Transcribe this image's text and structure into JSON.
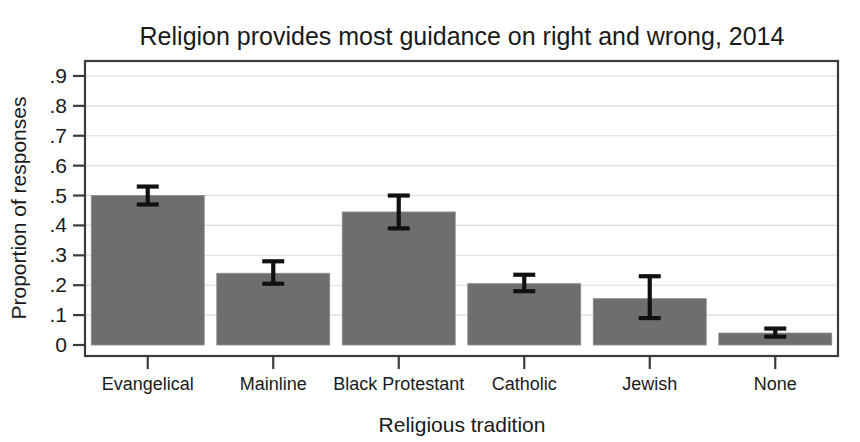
{
  "chart_data": {
    "type": "bar",
    "title": "Religion provides most guidance on right and wrong, 2014",
    "xlabel": "Religious tradition",
    "ylabel": "Proportion of responses",
    "categories": [
      "Evangelical",
      "Mainline",
      "Black Protestant",
      "Catholic",
      "Jewish",
      "None"
    ],
    "values": [
      0.5,
      0.24,
      0.445,
      0.205,
      0.155,
      0.04
    ],
    "error_low": [
      0.47,
      0.205,
      0.39,
      0.18,
      0.09,
      0.028
    ],
    "error_high": [
      0.53,
      0.28,
      0.5,
      0.235,
      0.23,
      0.055
    ],
    "ylim": [
      0,
      0.95
    ],
    "ytick_values": [
      0,
      0.1,
      0.2,
      0.3,
      0.4,
      0.5,
      0.6,
      0.7,
      0.8,
      0.9
    ],
    "ytick_labels": [
      "0",
      ".1",
      ".2",
      ".3",
      ".4",
      ".5",
      ".6",
      ".7",
      ".8",
      ".9"
    ],
    "grid": true,
    "legend": "none",
    "bar_color": "#6e6e6e",
    "bar_edge_color": "#8a8a8a",
    "error_bar_color": "#111111",
    "grid_color": "#dcdcdc",
    "frame_color": "#3b3b3b"
  }
}
